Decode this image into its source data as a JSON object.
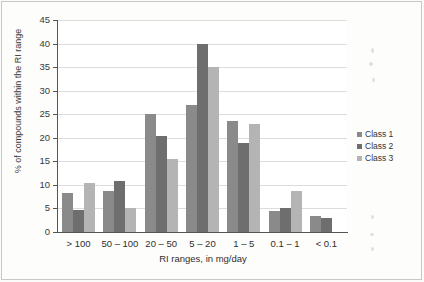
{
  "chart_data": {
    "type": "bar",
    "title": "",
    "subtitle": "",
    "xlabel": "RI ranges, in mg/day",
    "ylabel": "% of compounds within the RI range",
    "categories": [
      "> 100",
      "50 – 100",
      "20 – 50",
      "5 – 20",
      "1 – 5",
      "0.1 – 1",
      "< 0.1"
    ],
    "series": [
      {
        "name": "Class 1",
        "color": "#8a8a8a",
        "values": [
          8.2,
          8.8,
          25.0,
          27.0,
          23.5,
          4.5,
          3.5
        ]
      },
      {
        "name": "Class 2",
        "color": "#6e6e6e",
        "values": [
          4.7,
          10.8,
          20.3,
          40.0,
          19.0,
          5.0,
          3.0
        ]
      },
      {
        "name": "Class 3",
        "color": "#b4b4b4",
        "values": [
          10.4,
          5.0,
          15.5,
          35.0,
          23.0,
          8.7,
          0
        ]
      }
    ],
    "ylim": [
      0,
      45
    ],
    "ytick_step": 5,
    "yticks": [
      0,
      5,
      10,
      15,
      20,
      25,
      30,
      35,
      40,
      45
    ],
    "ytick_labels": [
      "0",
      "5",
      "10",
      "15",
      "20",
      "25",
      "30",
      "35",
      "40",
      "45"
    ],
    "grid": true,
    "grid_axis": "y",
    "legend_position": "right"
  },
  "legend": {
    "items": [
      {
        "label": "Class 1"
      },
      {
        "label": "Class 2"
      },
      {
        "label": "Class 3"
      }
    ]
  }
}
